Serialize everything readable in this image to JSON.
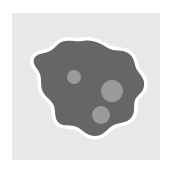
{
  "canvas": {
    "width": 174,
    "height": 173,
    "page_background": "#ffffff"
  },
  "card": {
    "label": "illustration-backdrop",
    "background_color": "#e8e8e8",
    "x": 12,
    "y": 13,
    "width": 148,
    "height": 147
  },
  "illustration": {
    "title": "Amoeba blob illustration",
    "alt_text": "Dark gray organic blob shape with white outline and three lighter gray circular spots",
    "blob": {
      "name": "organic-blob",
      "fill_color": "#666666",
      "outline_color": "#ffffff",
      "outline_width": 7,
      "path": "M 83 41 C 93 39 101 44 108 48 C 115 52 121 49 128 53 C 135 57 134 65 137 70 C 141 76 145 79 144 86 C 143 93 137 95 135 100 C 133 106 136 112 131 118 C 126 124 118 122 112 126 C 106 130 103 136 95 136 C 87 136 83 130 77 127 C 71 124 64 127 59 123 C 54 119 56 112 54 106 C 52 100 46 98 43 92 C 40 86 42 80 40 74 C 38 68 32 65 34 59 C 36 53 44 54 50 51 C 56 48 58 42 65 41 C 72 40 76 42 83 41 Z"
    },
    "spots": [
      {
        "name": "spot-top-left",
        "fill_color": "#9a9a9a",
        "cx": 74,
        "cy": 77,
        "r": 7
      },
      {
        "name": "spot-middle-right",
        "fill_color": "#9a9a9a",
        "cx": 112,
        "cy": 91,
        "r": 11
      },
      {
        "name": "spot-bottom-center",
        "fill_color": "#9a9a9a",
        "cx": 101,
        "cy": 115,
        "r": 9
      }
    ]
  }
}
